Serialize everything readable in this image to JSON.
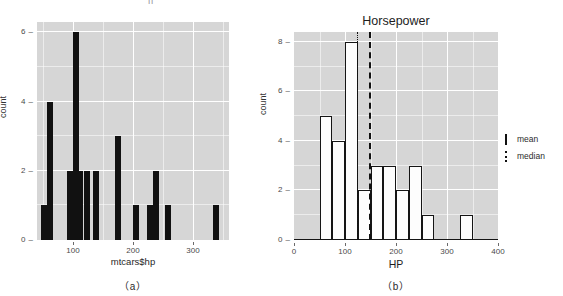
{
  "top_clipped_text": "· · ·   ·· ·    ·· ·   ·· ·· ·  ||   ·· · ··",
  "panel_a": {
    "caption": "（a）",
    "chart": {
      "type": "bar",
      "title": "",
      "xlabel": "mtcars$hp",
      "ylabel": "count",
      "xlim": [
        40,
        360
      ],
      "ylim": [
        0,
        6.3
      ],
      "xticks": [
        100,
        200,
        300
      ],
      "yticks": [
        0,
        2,
        4,
        6
      ],
      "grid": true,
      "bin_width": 10,
      "bins": [
        {
          "x": 52,
          "count": 1
        },
        {
          "x": 62,
          "count": 4
        },
        {
          "x": 95,
          "count": 2
        },
        {
          "x": 105,
          "count": 6
        },
        {
          "x": 112,
          "count": 2
        },
        {
          "x": 123,
          "count": 2
        },
        {
          "x": 138,
          "count": 2
        },
        {
          "x": 175,
          "count": 3
        },
        {
          "x": 205,
          "count": 1
        },
        {
          "x": 228,
          "count": 1
        },
        {
          "x": 238,
          "count": 2
        },
        {
          "x": 258,
          "count": 1
        },
        {
          "x": 338,
          "count": 1
        }
      ]
    }
  },
  "panel_b": {
    "caption": "（b）",
    "chart": {
      "type": "bar",
      "title": "Horsepower",
      "xlabel": "HP",
      "ylabel": "count",
      "xlim": [
        0,
        400
      ],
      "ylim": [
        0,
        8.4
      ],
      "xticks": [
        0,
        100,
        200,
        300,
        400
      ],
      "yticks": [
        0,
        2,
        4,
        6,
        8
      ],
      "grid": true,
      "bin_width": 25,
      "bins": [
        {
          "x0": 50,
          "x1": 75,
          "count": 5
        },
        {
          "x0": 75,
          "x1": 100,
          "count": 4
        },
        {
          "x0": 100,
          "x1": 125,
          "count": 8
        },
        {
          "x0": 125,
          "x1": 150,
          "count": 2
        },
        {
          "x0": 150,
          "x1": 175,
          "count": 3
        },
        {
          "x0": 175,
          "x1": 200,
          "count": 3
        },
        {
          "x0": 200,
          "x1": 225,
          "count": 2
        },
        {
          "x0": 225,
          "x1": 250,
          "count": 3
        },
        {
          "x0": 250,
          "x1": 275,
          "count": 1
        },
        {
          "x0": 325,
          "x1": 350,
          "count": 1
        }
      ],
      "reference_lines": [
        {
          "name": "median",
          "value": 123,
          "style": "dotted"
        },
        {
          "name": "mean",
          "value": 147,
          "style": "dashed"
        }
      ],
      "legend": {
        "position": "right",
        "entries": [
          {
            "label": "mean",
            "style": "dashed"
          },
          {
            "label": "median",
            "style": "dotted"
          }
        ]
      }
    }
  }
}
